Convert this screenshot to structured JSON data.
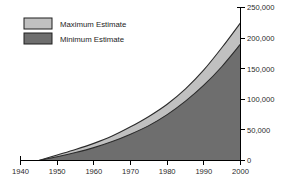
{
  "chart_data": {
    "type": "area",
    "title": "",
    "subtitle": "",
    "xlabel": "",
    "ylabel": "",
    "x": [
      1945,
      1950,
      1955,
      1960,
      1965,
      1970,
      1975,
      1980,
      1985,
      1990,
      1995,
      2000
    ],
    "series": [
      {
        "name": "Maximum Estimate",
        "color": "#c0c0c0",
        "values": [
          0,
          9000,
          18000,
          28000,
          40000,
          55000,
          72000,
          92000,
          117000,
          148000,
          185000,
          225000
        ]
      },
      {
        "name": "Minimum Estimate",
        "color": "#6e6e6e",
        "values": [
          0,
          6000,
          13000,
          21000,
          31000,
          43000,
          57000,
          75000,
          97000,
          123000,
          154000,
          190000
        ]
      }
    ],
    "xlim": [
      1940,
      2000
    ],
    "ylim": [
      0,
      250000
    ],
    "xticks": [
      1940,
      1950,
      1960,
      1970,
      1980,
      1990,
      2000
    ],
    "xtick_labels": [
      "1940",
      "1950",
      "1960",
      "1970",
      "1980",
      "1990",
      "2000"
    ],
    "yticks": [
      0,
      50000,
      100000,
      150000,
      200000,
      250000
    ],
    "ytick_labels": [
      "0",
      "50,000",
      "100,000",
      "150,000",
      "200,000",
      "250,000"
    ],
    "y_axis_position": "right",
    "grid": false,
    "legend_position": "top-left",
    "legend": [
      {
        "label": "Maximum Estimate",
        "color": "#c0c0c0"
      },
      {
        "label": "Minimum Estimate",
        "color": "#6e6e6e"
      }
    ],
    "background_color": "#ffffff",
    "outline_color": "#2b2b2b"
  }
}
